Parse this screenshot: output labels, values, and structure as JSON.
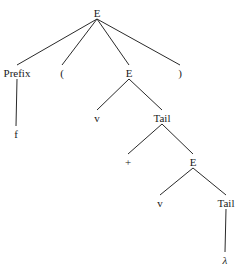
{
  "diagram": {
    "type": "parse-tree",
    "nodes": [
      {
        "id": "E0",
        "label": "E"
      },
      {
        "id": "Prefix",
        "label": "Prefix"
      },
      {
        "id": "lparen",
        "label": "("
      },
      {
        "id": "E1",
        "label": "E"
      },
      {
        "id": "rparen",
        "label": ")"
      },
      {
        "id": "f",
        "label": "f"
      },
      {
        "id": "v1",
        "label": "v"
      },
      {
        "id": "Tail1",
        "label": "Tail"
      },
      {
        "id": "plus",
        "label": "+"
      },
      {
        "id": "E2",
        "label": "E"
      },
      {
        "id": "v2",
        "label": "v"
      },
      {
        "id": "Tail2",
        "label": "Tail"
      },
      {
        "id": "lambda",
        "label": "λ",
        "italic": true
      }
    ],
    "edges": [
      [
        "E0",
        "Prefix"
      ],
      [
        "E0",
        "lparen"
      ],
      [
        "E0",
        "E1"
      ],
      [
        "E0",
        "rparen"
      ],
      [
        "Prefix",
        "f"
      ],
      [
        "E1",
        "v1"
      ],
      [
        "E1",
        "Tail1"
      ],
      [
        "Tail1",
        "plus"
      ],
      [
        "Tail1",
        "E2"
      ],
      [
        "E2",
        "v2"
      ],
      [
        "E2",
        "Tail2"
      ],
      [
        "Tail2",
        "lambda"
      ]
    ]
  }
}
